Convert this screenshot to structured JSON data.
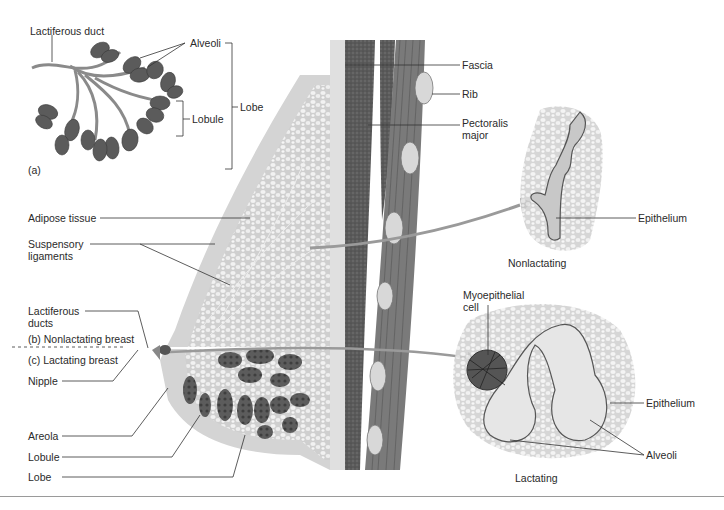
{
  "figure": {
    "panels": {
      "a": {
        "tag": "(a)"
      },
      "b": {
        "tag": "(b)",
        "title": "Nonlactating breast"
      },
      "c": {
        "tag": "(c)",
        "title": "Lactating breast"
      }
    },
    "panel_a_labels": {
      "lactiferous_duct": "Lactiferous duct",
      "alveoli": "Alveoli",
      "lobule": "Lobule",
      "lobe": "Lobe"
    },
    "left_labels": {
      "adipose_tissue": "Adipose tissue",
      "suspensory_ligaments_1": "Suspensory",
      "suspensory_ligaments_2": "ligaments",
      "lactiferous_ducts_1": "Lactiferous",
      "lactiferous_ducts_2": "ducts",
      "nonlactating_breast": "(b)  Nonlactating breast",
      "lactating_breast": "(c)  Lactating breast",
      "nipple": "Nipple",
      "areola": "Areola",
      "lobule": "Lobule",
      "lobe": "Lobe"
    },
    "chest_wall_labels": {
      "fascia": "Fascia",
      "rib": "Rib",
      "pectoralis_major_1": "Pectoralis",
      "pectoralis_major_2": "major"
    },
    "inset_nonlactating": {
      "epithelium": "Epithelium",
      "caption": "Nonlactating"
    },
    "inset_lactating": {
      "myoepithelial_cell_1": "Myoepithelial",
      "myoepithelial_cell_2": "cell",
      "epithelium": "Epithelium",
      "alveoli": "Alveoli",
      "caption": "Lactating"
    },
    "colors": {
      "skin": "#d9d9d9",
      "adipose": "#e8e8e8",
      "muscle": "#5e5e5e",
      "glandular": "#555555",
      "leader_line": "#333333",
      "arrow": "#9a9a9a"
    }
  }
}
